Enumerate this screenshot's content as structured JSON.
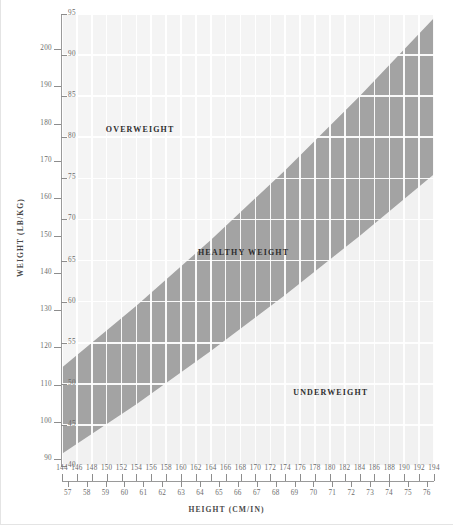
{
  "page": {
    "bleed_text_left": "",
    "bleed_text_right": ""
  },
  "axes": {
    "y_title": "WEIGHT (LB/KG)",
    "x_title": "HEIGHT (CM/IN)",
    "y_lb_ticks": [
      90,
      100,
      110,
      120,
      130,
      140,
      150,
      160,
      170,
      180,
      190,
      200,
      210
    ],
    "y_kg_ticks": [
      40,
      45,
      50,
      55,
      60,
      65,
      70,
      75,
      80,
      85,
      90,
      95
    ],
    "x_cm_ticks": [
      144,
      146,
      148,
      150,
      152,
      154,
      156,
      158,
      160,
      162,
      164,
      166,
      168,
      170,
      172,
      174,
      176,
      178,
      180,
      182,
      184,
      186,
      188,
      190,
      192,
      194
    ],
    "x_in_ticks": [
      57,
      58,
      59,
      60,
      61,
      62,
      63,
      64,
      65,
      66,
      67,
      68,
      69,
      70,
      71,
      72,
      73,
      74,
      75,
      76
    ]
  },
  "regions": [
    {
      "id": "overweight",
      "label": "OVERWEIGHT",
      "color": "#f4f4f4"
    },
    {
      "id": "healthy",
      "label": "HEALTHY WEIGHT",
      "color": "#a3a3a3"
    },
    {
      "id": "underweight",
      "label": "UNDERWEIGHT",
      "color": "#f1f1f1"
    }
  ],
  "colors": {
    "plot_background": "#efefef",
    "healthy_band": "#a3a3a3",
    "overweight_band": "#f4f4f4",
    "underweight_band": "#f1f1f1",
    "gridline": "#ffffff",
    "axis_line": "#9a9a9a",
    "tick_text": "#6b6b6b",
    "title_text": "#4a4a4a",
    "page_background": "#ffffff"
  },
  "chart_data": {
    "type": "area",
    "xlabel": "HEIGHT (CM/IN)",
    "ylabel": "WEIGHT (LB/KG)",
    "xlim_cm": [
      144,
      194
    ],
    "ylim_kg": [
      40,
      95
    ],
    "ylim_lb": [
      88,
      209
    ],
    "grid": true,
    "legend": "in-plot region labels",
    "x_unit_primary": "cm",
    "x_unit_secondary": "in",
    "y_unit_primary": "lb",
    "y_unit_secondary": "kg",
    "x_cm_tick_labels": [
      144,
      146,
      148,
      150,
      152,
      154,
      156,
      158,
      160,
      162,
      164,
      166,
      168,
      170,
      172,
      174,
      176,
      178,
      180,
      182,
      184,
      186,
      188,
      190,
      192,
      194
    ],
    "x_in_tick_labels": [
      57,
      58,
      59,
      60,
      61,
      62,
      63,
      64,
      65,
      66,
      67,
      68,
      69,
      70,
      71,
      72,
      73,
      74,
      75,
      76
    ],
    "y_lb_tick_labels": [
      90,
      100,
      110,
      120,
      130,
      140,
      150,
      160,
      170,
      180,
      190,
      200,
      210
    ],
    "y_kg_tick_labels": [
      40,
      45,
      50,
      55,
      60,
      65,
      70,
      75,
      80,
      85,
      90,
      95
    ],
    "bands": [
      {
        "name": "OVERWEIGHT",
        "position": "above healthy band (upper-left region)",
        "color": "#f4f4f4",
        "label_at": {
          "height_cm": 155,
          "weight_kg": 81
        }
      },
      {
        "name": "HEALTHY WEIGHT",
        "position": "diagonal band (BMI approx 18.5 to 25)",
        "color": "#a3a3a3",
        "lower_bound_bmi": 18.5,
        "upper_bound_bmi": 25.0,
        "label_at": {
          "height_cm": 169,
          "weight_kg": 66
        },
        "lower_edge_points": [
          {
            "height_cm": 144,
            "weight_kg": 41.5
          },
          {
            "height_cm": 154,
            "weight_kg": 47.5
          },
          {
            "height_cm": 164,
            "weight_kg": 54.0
          },
          {
            "height_cm": 174,
            "weight_kg": 60.8
          },
          {
            "height_cm": 184,
            "weight_kg": 68.0
          },
          {
            "height_cm": 194,
            "weight_kg": 75.5
          }
        ],
        "upper_edge_points": [
          {
            "height_cm": 144,
            "weight_kg": 52.0
          },
          {
            "height_cm": 154,
            "weight_kg": 59.5
          },
          {
            "height_cm": 164,
            "weight_kg": 67.5
          },
          {
            "height_cm": 174,
            "weight_kg": 76.0
          },
          {
            "height_cm": 184,
            "weight_kg": 85.0
          },
          {
            "height_cm": 194,
            "weight_kg": 94.5
          }
        ]
      },
      {
        "name": "UNDERWEIGHT",
        "position": "below healthy band (lower-right region)",
        "color": "#f1f1f1",
        "label_at": {
          "height_cm": 181,
          "weight_kg": 49
        }
      }
    ]
  }
}
